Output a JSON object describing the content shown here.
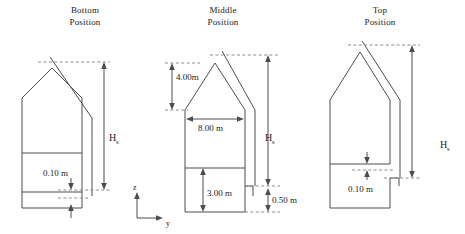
{
  "figure": {
    "kind": "engineering-cross-section-diagram",
    "line_color": "#4d4d4d",
    "dashed_color": "#8c8c8c",
    "background": "#ffffff"
  },
  "panels": [
    {
      "id": "bottom",
      "title_line1": "Bottom",
      "title_line2": "Position",
      "height_label": "H",
      "height_sub": "s",
      "gap_label": "0.10 m"
    },
    {
      "id": "middle",
      "title_line1": "Middle",
      "title_line2": "Position",
      "height_label": "H",
      "height_sub": "s",
      "roof_height_label": "4.00m",
      "width_label": "8.00 m",
      "wall_height_label": "3.00 m",
      "gap_label": "0.50 m"
    },
    {
      "id": "top",
      "title_line1": "Top",
      "title_line2": "Position",
      "height_label": "H",
      "height_sub": "s",
      "gap_label": "0.10 m"
    }
  ],
  "axes": {
    "name": "coordinate-indicator",
    "vertical_label": "z",
    "horizontal_label": "y"
  }
}
